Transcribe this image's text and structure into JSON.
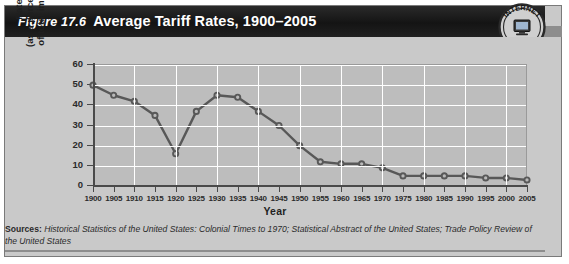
{
  "figure": {
    "number_label": "Figure 17.6",
    "title": "Average Tariff Rates, 1900–2005",
    "seal": {
      "top_text": "INTERNET",
      "bottom_text": "UPDATE",
      "icon": "computer-monitor-icon"
    },
    "sources_prefix": "Sources:",
    "sources_text": " Historical Statistics of the United States: Colonial Times to 1970; Statistical Abstract of the United States; Trade Policy Review of the United States"
  },
  "colors": {
    "panel_background": "#c9c9c9",
    "plot_background": "#bdbdbd",
    "title_bar": "#1d1d1d",
    "title_text": "#ffffff",
    "series_line": "#585858",
    "gridline": "#ffffff",
    "axis": "#4a4a4a"
  },
  "chart_data": {
    "type": "line",
    "title": "Average Tariff Rates, 1900–2005",
    "xlabel": "Year",
    "ylabel": "Rate (as a percentage of total imports)",
    "ylabel_lines": [
      "Rate",
      "(as a percentage",
      "of total imports)"
    ],
    "xlim": [
      1900,
      2005
    ],
    "ylim": [
      0,
      60
    ],
    "ytick_values": [
      0,
      10,
      20,
      30,
      40,
      50,
      60
    ],
    "ytick_labels": [
      "0",
      "10",
      "20",
      "30",
      "40",
      "50",
      "60"
    ],
    "xtick_labels": [
      "1900",
      "1905",
      "1910",
      "1915",
      "1920",
      "1925",
      "1930",
      "1935",
      "1940",
      "1945",
      "1950",
      "1955",
      "1960",
      "1965",
      "1970",
      "1975",
      "1980",
      "1985",
      "1990",
      "1995",
      "2000",
      "2005"
    ],
    "categories": [
      1900,
      1905,
      1910,
      1915,
      1920,
      1925,
      1930,
      1935,
      1940,
      1945,
      1950,
      1955,
      1960,
      1965,
      1970,
      1975,
      1980,
      1985,
      1990,
      1995,
      2000,
      2005
    ],
    "values": [
      50,
      45,
      42,
      35,
      16,
      37,
      45,
      44,
      37,
      30,
      20,
      12,
      11,
      11,
      9,
      5,
      5,
      5,
      5,
      4,
      4,
      3
    ],
    "markers": true,
    "grid": true,
    "legend": false
  }
}
